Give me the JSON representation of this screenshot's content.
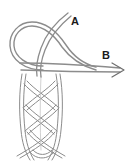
{
  "figure": {
    "background_color": "#ffffff",
    "stroke_color": "#8c8c8c",
    "stroke_color_dark": "#6e6e6e",
    "label_color": "#1a1a1a",
    "width": 129,
    "height": 166
  },
  "labels": [
    {
      "id": "a",
      "text": "A",
      "name": "label-a",
      "meaning": "standing-end-label",
      "x": 71,
      "y": 16
    },
    {
      "id": "b",
      "text": "B",
      "name": "label-b",
      "meaning": "working-end-label",
      "x": 102,
      "y": 50
    }
  ],
  "annotations": {
    "arrow": {
      "name": "direction-arrow",
      "points_to": "B",
      "direction": "right",
      "tip_x": 124,
      "tip_y": 70
    }
  }
}
